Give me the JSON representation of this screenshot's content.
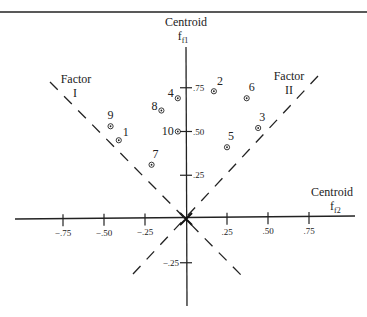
{
  "chart_data": {
    "type": "scatter",
    "title": "",
    "xlabel": "Centroid f2",
    "ylabel": "Centroid f1",
    "x_axis": {
      "name": "Centroid",
      "sub": "f2",
      "ticks": [
        "-.75",
        "-.50",
        "-.25",
        ".25",
        ".50",
        ".75"
      ],
      "tick_values": [
        -0.75,
        -0.5,
        -0.25,
        0.25,
        0.5,
        0.75
      ]
    },
    "y_axis": {
      "name": "Centroid",
      "sub": "f1",
      "ticks": [
        ".75",
        ".50",
        ".25",
        "-.25"
      ],
      "tick_values": [
        0.75,
        0.5,
        0.25,
        -0.25
      ]
    },
    "xlim": [
      -0.85,
      1.0
    ],
    "ylim": [
      -0.55,
      0.92
    ],
    "grid": false,
    "rotated_axes": [
      {
        "name": "Factor I",
        "label_line1": "Factor",
        "label_line2": "I",
        "direction": "upper-left diagonal",
        "style": "dashed"
      },
      {
        "name": "Factor II",
        "label_line1": "Factor",
        "label_line2": "II",
        "direction": "upper-right diagonal",
        "style": "dashed"
      }
    ],
    "points": [
      {
        "label": "1",
        "x": -0.41,
        "y": 0.45
      },
      {
        "label": "2",
        "x": 0.17,
        "y": 0.73
      },
      {
        "label": "3",
        "x": 0.44,
        "y": 0.52
      },
      {
        "label": "4",
        "x": -0.05,
        "y": 0.69
      },
      {
        "label": "5",
        "x": 0.25,
        "y": 0.41
      },
      {
        "label": "6",
        "x": 0.37,
        "y": 0.69
      },
      {
        "label": "7",
        "x": -0.21,
        "y": 0.31
      },
      {
        "label": "8",
        "x": -0.15,
        "y": 0.62
      },
      {
        "label": "9",
        "x": -0.46,
        "y": 0.53
      },
      {
        "label": "10",
        "x": -0.05,
        "y": 0.5
      }
    ]
  }
}
